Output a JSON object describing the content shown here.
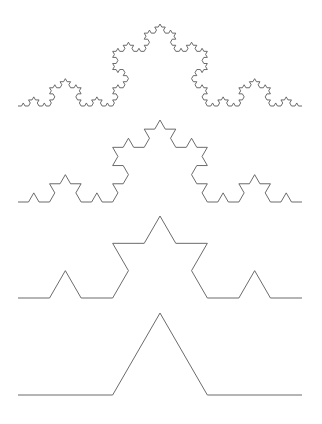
{
  "figure": {
    "background_color": "#ffffff",
    "stroke_color": "#5a5a5a",
    "stroke_width": 0.9,
    "canvas": {
      "width": 322,
      "height": 424
    }
  },
  "chart_data": {
    "type": "line",
    "subtitle": "",
    "xlabel": "",
    "ylabel": "",
    "grid": false,
    "legend_position": "none",
    "axis_visible": false,
    "xlim": [
      0,
      322
    ],
    "ylim": [
      424,
      0
    ],
    "generator": {
      "rule": "koch",
      "segment_split": 3,
      "bump_angle_degrees": 60
    },
    "series": [
      {
        "name": "iteration-4",
        "order": 1,
        "iterations": 4,
        "segment_count": 256,
        "baseline_y": 106,
        "x_start": 18,
        "x_end": 302,
        "apex_x": 160,
        "apex_y": 24,
        "peak_height": 82
      },
      {
        "name": "iteration-3",
        "order": 2,
        "iterations": 3,
        "segment_count": 64,
        "baseline_y": 202,
        "x_start": 18,
        "x_end": 302,
        "apex_x": 160,
        "apex_y": 120,
        "peak_height": 82
      },
      {
        "name": "iteration-2",
        "order": 3,
        "iterations": 2,
        "segment_count": 16,
        "baseline_y": 298,
        "x_start": 18,
        "x_end": 302,
        "apex_x": 160,
        "apex_y": 216,
        "peak_height": 82
      },
      {
        "name": "iteration-1",
        "order": 4,
        "iterations": 1,
        "segment_count": 4,
        "baseline_y": 395,
        "x_start": 18,
        "x_end": 302,
        "apex_x": 160,
        "apex_y": 313,
        "peak_height": 82,
        "vertices": [
          [
            18,
            395
          ],
          [
            112.67,
            395
          ],
          [
            160,
            313
          ],
          [
            207.33,
            395
          ],
          [
            302,
            395
          ]
        ]
      }
    ]
  }
}
